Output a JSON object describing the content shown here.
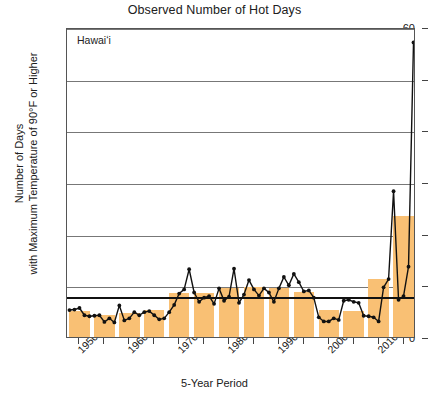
{
  "chart_data": {
    "type": "bar",
    "title": "Observed Number of Hot Days",
    "panel_label": "Hawaiʻi",
    "xlabel": "5-Year Period",
    "ylabel_line1": "Number of Days",
    "ylabel_line2": "with Maximum Temperature of 90°F or Higher",
    "ylim": [
      0,
      60
    ],
    "yticks": [
      0,
      10,
      20,
      30,
      40,
      50,
      60
    ],
    "grid": "horizontal",
    "legend": "none",
    "bar_color": "#f9c074",
    "line_color": "#111111",
    "reference_line_value": 8.2,
    "categories": [
      "1950–54",
      "1955–59",
      "1960–64",
      "1965–69",
      "1970–74",
      "1975–79",
      "1980–84",
      "1985–89",
      "1990–94",
      "1995–99",
      "2000–04",
      "2005–09",
      "2010–14",
      "2015–19"
    ],
    "xtick_labels": [
      "1950–54",
      "1960–64",
      "1970–74",
      "1980–84",
      "1990–94",
      "2000–04",
      "2010–14"
    ],
    "xtick_label_indices": [
      0,
      2,
      4,
      6,
      8,
      10,
      12
    ],
    "values": [
      5.0,
      4.3,
      4.6,
      5.2,
      8.5,
      8.6,
      9.4,
      9.6,
      9.4,
      8.8,
      5.2,
      5.0,
      11.2,
      23.4
    ],
    "annual_series": {
      "name": "Annual number of hot days",
      "x": [
        1950,
        1951,
        1952,
        1953,
        1954,
        1955,
        1956,
        1957,
        1958,
        1959,
        1960,
        1961,
        1962,
        1963,
        1964,
        1965,
        1966,
        1967,
        1968,
        1969,
        1970,
        1971,
        1972,
        1973,
        1974,
        1975,
        1976,
        1977,
        1978,
        1979,
        1980,
        1981,
        1982,
        1983,
        1984,
        1985,
        1986,
        1987,
        1988,
        1989,
        1990,
        1991,
        1992,
        1993,
        1994,
        1995,
        1996,
        1997,
        1998,
        1999,
        2000,
        2001,
        2002,
        2003,
        2004,
        2005,
        2006,
        2007,
        2008,
        2009,
        2010,
        2011,
        2012,
        2013,
        2014,
        2015,
        2016,
        2017,
        2018,
        2019
      ],
      "values": [
        5.6,
        5.7,
        6.0,
        4.6,
        4.4,
        4.5,
        4.6,
        3.3,
        4.0,
        3.2,
        6.5,
        3.6,
        4.0,
        5.2,
        4.6,
        5.2,
        5.4,
        4.6,
        3.8,
        4.0,
        5.2,
        6.6,
        8.8,
        9.6,
        13.5,
        9.0,
        7.2,
        8.0,
        8.3,
        6.8,
        9.8,
        7.4,
        8.2,
        13.6,
        7.0,
        8.6,
        11.4,
        9.6,
        8.4,
        9.8,
        9.0,
        7.2,
        9.8,
        12.0,
        10.4,
        12.6,
        11.0,
        9.2,
        9.4,
        8.0,
        4.2,
        3.4,
        3.4,
        4.0,
        3.7,
        7.4,
        7.6,
        7.2,
        7.0,
        4.5,
        4.4,
        4.2,
        3.4,
        10.0,
        11.6,
        28.6,
        7.6,
        8.3,
        14.0,
        57.4
      ]
    }
  }
}
